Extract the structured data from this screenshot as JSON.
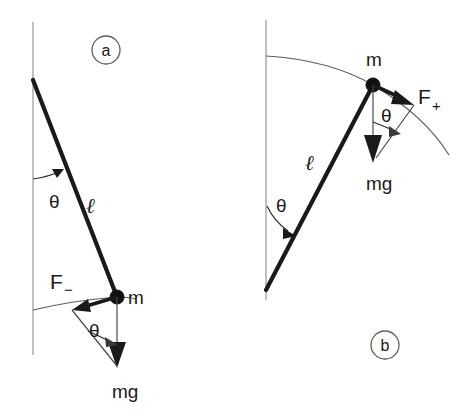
{
  "figure": {
    "background_color": "#ffffff",
    "line_color": "#1a1a1a",
    "reference_line_color": "#8c8c8c",
    "arc_color": "#5a5a5a",
    "width": 471,
    "height": 416
  },
  "panels": [
    {
      "id": "a",
      "badge_label": "a",
      "description": "Pendulum displaced to the right of vertical, swinging back; restoring force F minus points down-left along the tangent.",
      "labels": {
        "mass": "m",
        "length": "ℓ",
        "angle": "θ",
        "force": "F",
        "force_subscript": "−",
        "weight": "mg"
      }
    },
    {
      "id": "b",
      "badge_label": "b",
      "description": "Pendulum rising to the right, driving force F plus points up-right along the tangent.",
      "labels": {
        "mass": "m",
        "length": "ℓ",
        "angle": "θ",
        "force": "F",
        "force_subscript": "+",
        "weight": "mg"
      }
    }
  ],
  "geometry": {
    "panel_a": {
      "pivot": [
        33,
        80
      ],
      "bob": [
        117,
        297
      ],
      "vertical_top": [
        33,
        22
      ],
      "vertical_bottom": [
        33,
        355
      ],
      "angle_arc_label_pos": [
        57,
        200
      ],
      "length_label_pos": [
        93,
        212
      ],
      "force_label_pos": [
        56,
        285
      ],
      "weight_label_pos": [
        130,
        396
      ],
      "mass_label_pos": [
        131,
        303
      ],
      "vertex_angle_label_pos": [
        98,
        332
      ],
      "badge_center": [
        106,
        50
      ],
      "badge_radius": 14
    },
    "panel_b": {
      "pivot": [
        266,
        290
      ],
      "bob": [
        373,
        85
      ],
      "vertical_top": [
        266,
        20
      ],
      "vertical_bottom": [
        266,
        300
      ],
      "angle_arc_label_pos": [
        283,
        205
      ],
      "length_label_pos": [
        313,
        163
      ],
      "force_label_pos": [
        423,
        97
      ],
      "weight_label_pos": [
        385,
        185
      ],
      "mass_label_pos": [
        372,
        60
      ],
      "vertex_angle_label_pos": [
        390,
        120
      ],
      "badge_center": [
        385,
        345
      ],
      "badge_radius": 14
    }
  }
}
